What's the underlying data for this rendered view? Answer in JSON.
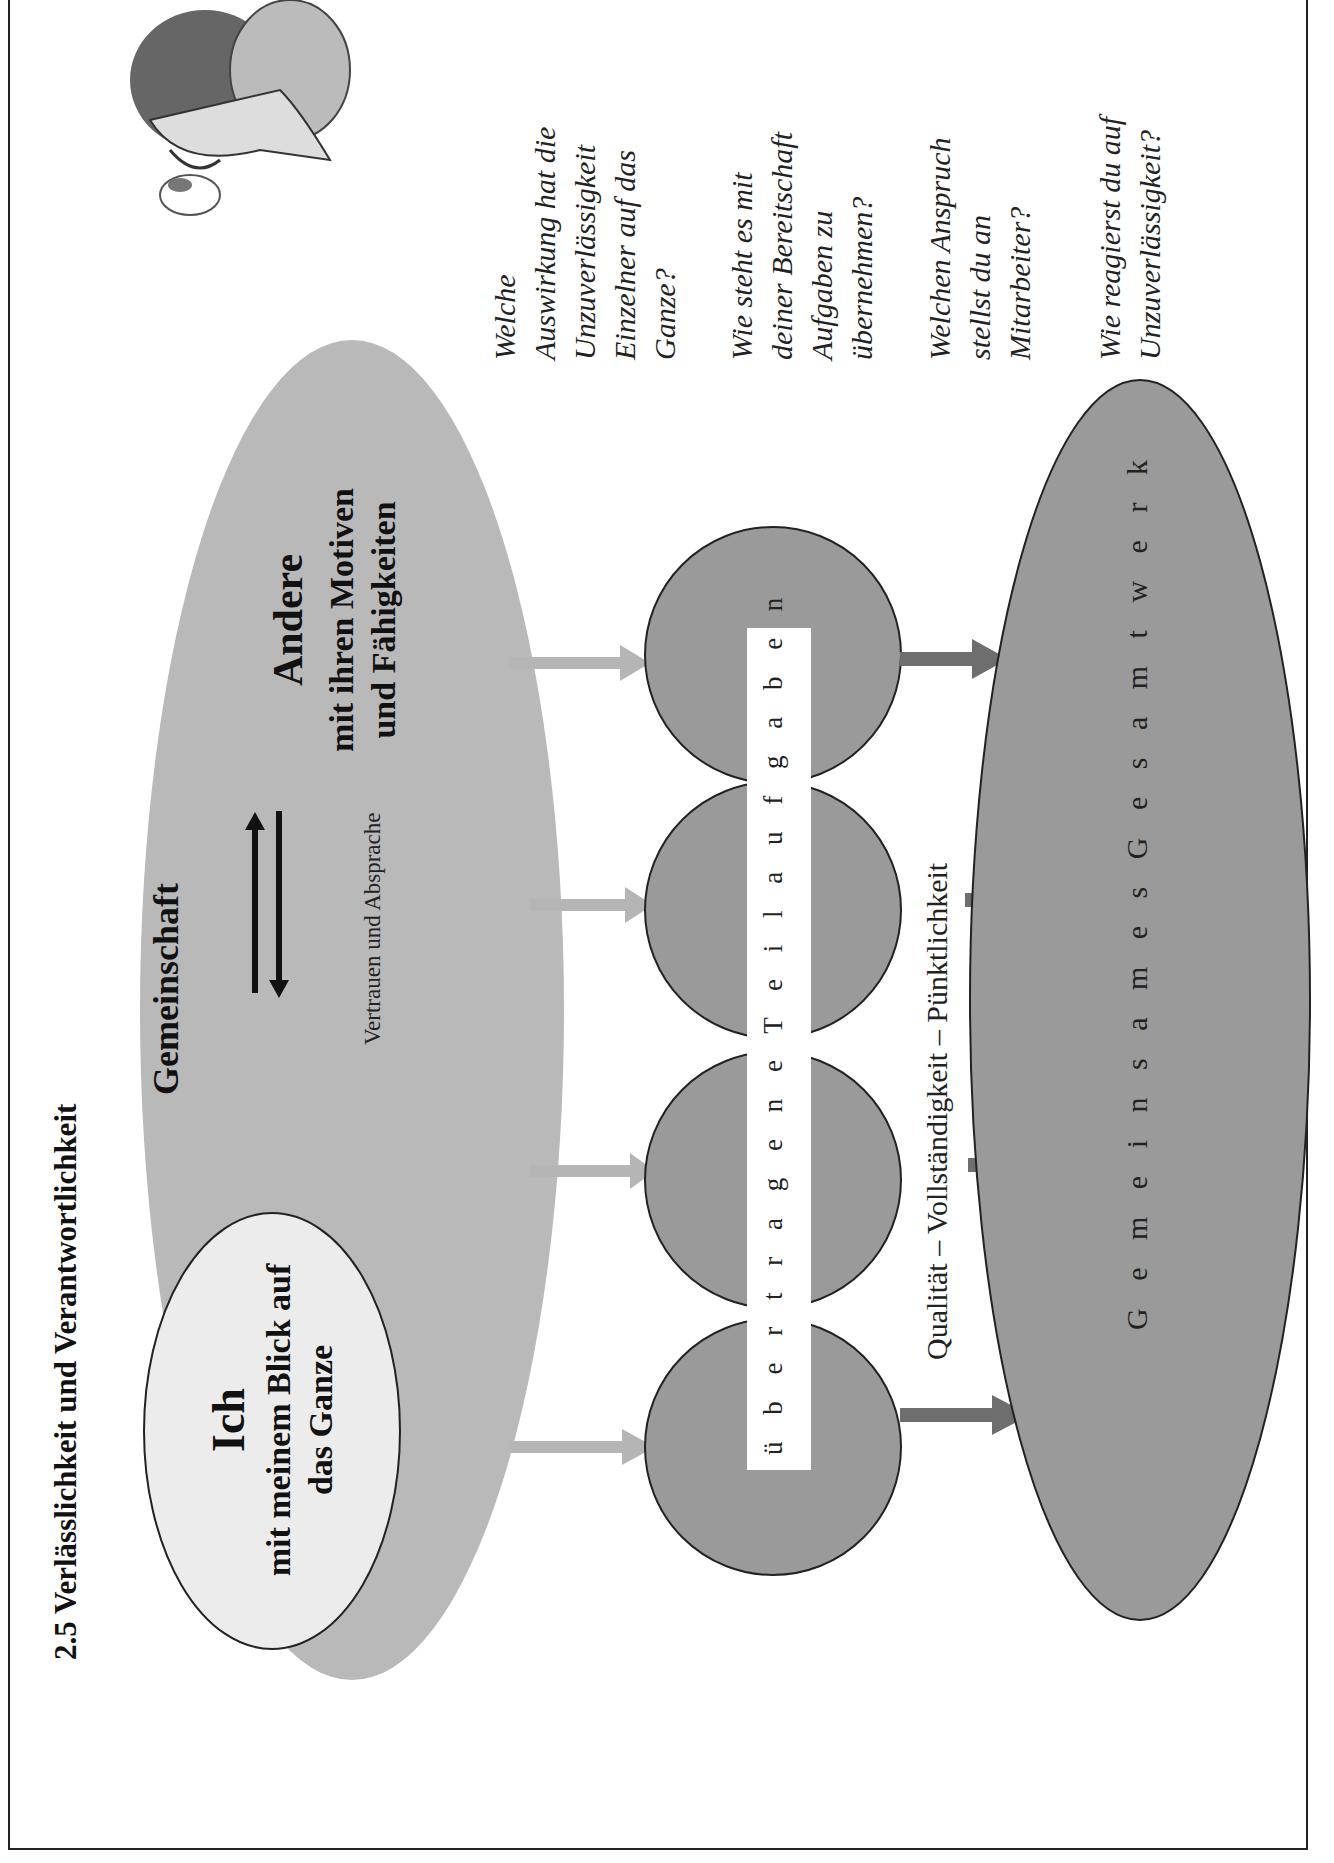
{
  "title": "2.5  Verlässlichkeit und Verantwortlichkeit",
  "community": {
    "label": "Gemeinschaft",
    "relation_label": "Vertrauen und Absprache",
    "fill": "#b9b9b9"
  },
  "self": {
    "heading": "Ich",
    "line1": "mit meinem Blick auf",
    "line2": "das Ganze",
    "fill": "#ececec"
  },
  "others": {
    "heading": "Andere",
    "line1": "mit ihren Motiven",
    "line2": "und Fähigkeiten"
  },
  "tasks": {
    "label": "ü b e r t r a g e n e   T e i l a u f g a b e n",
    "circle_count": 4,
    "fill": "#9a9a9a"
  },
  "criteria": "Qualität – Vollständigkeit – Pünktlichkeit",
  "result": {
    "label": "G e m e i n s a m e s   G e s a m t w e r k",
    "fill": "#9a9a9a"
  },
  "questions": [
    {
      "lines": [
        "Welche",
        "Auswirkung hat die",
        "Unzuverlässigkeit",
        "Einzelner auf das",
        "Ganze?"
      ]
    },
    {
      "lines": [
        "Wie steht es mit",
        "deiner Bereitschaft",
        "Aufgaben zu",
        "übernehmen?"
      ]
    },
    {
      "lines": [
        "Welchen Anspruch",
        "stellst du an",
        "Mitarbeiter?"
      ]
    },
    {
      "lines": [
        "Wie reagierst du auf",
        "Unzuverlässigkeit?"
      ]
    }
  ],
  "illustration": "Man with magnifying glass examining a butterfly",
  "colors": {
    "light_arrow": "#b5b5b5",
    "dark_arrow": "#6e6e6e",
    "outline": "#222222"
  }
}
